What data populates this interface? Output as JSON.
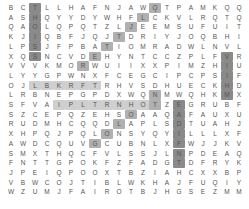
{
  "puzzle": {
    "type": "word-search",
    "cols": 20,
    "rows_count": 20,
    "rows": [
      "BCTLLHAFNJAWQTPAMKQQ",
      "ASHQYYDYWHFLCKVLRQTQ",
      "QAOLQPQTZLJEEMSUFUIT",
      "KJIQBFJQJTDRIYJOQBHI",
      "LPSJFPBATIOMRADWLNVL",
      "XQSNCVDEHYNTCCZPLFVR",
      "VVVKMORWUIIXXPIMZHIU",
      "LYYGPWNXFCEGCIPCPSIF",
      "OJLBKRFTRHVSDHUECKHD",
      "LRBNEPGPDXWQNMWQHKMX",
      "SFVAIPLTRNHOTZEGRUBFX",
      "SZCEPQZEHSOAAQAFAUXU",
      "RUDMHCQQDLAPLSDTUAHJ",
      "XHPQJPQLONSYQYILLLXF",
      "AWDCQUVGCUBNLXFWJJKV",
      "SMXTHQCFVLSSJLNPDEAQ",
      "FNTTGPOKFZFADGTDFRYK",
      "JPEIQPOOXTBZIAHCXXBP",
      "VBWCOJTIBLWKHAJFUQIY",
      "WZUMJFAIROTBJHGSEZMM"
    ],
    "highlights": [
      {
        "cells": [
          [
            0,
            2
          ],
          [
            1,
            2
          ],
          [
            2,
            2
          ],
          [
            3,
            2
          ],
          [
            4,
            2
          ],
          [
            5,
            2
          ]
        ],
        "color": "#8a8a8a"
      },
      {
        "cells": [
          [
            0,
            12
          ],
          [
            1,
            11
          ],
          [
            2,
            10
          ],
          [
            3,
            9
          ],
          [
            4,
            8
          ],
          [
            5,
            7
          ],
          [
            6,
            6
          ]
        ],
        "color": "#b0b0b0"
      },
      {
        "cells": [
          [
            5,
            18
          ],
          [
            6,
            18
          ],
          [
            7,
            18
          ],
          [
            8,
            18
          ],
          [
            9,
            18
          ]
        ],
        "color": "#8a8a8a"
      },
      {
        "cells": [
          [
            8,
            2
          ],
          [
            8,
            3
          ],
          [
            8,
            4
          ],
          [
            8,
            5
          ],
          [
            8,
            6
          ],
          [
            8,
            7
          ]
        ],
        "color": "#cfcfcf"
      },
      {
        "cells": [
          [
            10,
            4
          ],
          [
            10,
            5
          ],
          [
            10,
            6
          ],
          [
            10,
            7
          ],
          [
            10,
            8
          ],
          [
            10,
            9
          ],
          [
            10,
            10
          ],
          [
            10,
            11
          ],
          [
            10,
            12
          ]
        ],
        "color": "#cfcfcf"
      },
      {
        "cells": [
          [
            9,
            12
          ],
          [
            10,
            12
          ],
          [
            11,
            10
          ],
          [
            12,
            9
          ],
          [
            13,
            8
          ],
          [
            14,
            7
          ]
        ],
        "color": "#b0b0b0"
      },
      {
        "cells": [
          [
            10,
            14
          ],
          [
            11,
            14
          ],
          [
            12,
            14
          ],
          [
            13,
            14
          ],
          [
            14,
            14
          ],
          [
            15,
            14
          ],
          [
            16,
            14
          ]
        ],
        "color": "#8a8a8a"
      }
    ]
  }
}
